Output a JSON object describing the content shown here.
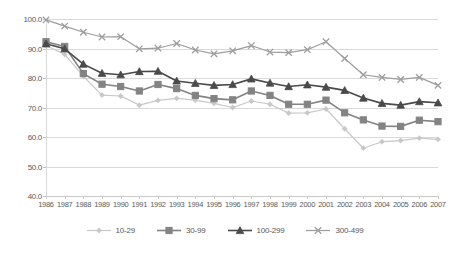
{
  "chart_data": {
    "type": "line",
    "title": "",
    "xlabel": "",
    "ylabel": "",
    "grid": true,
    "legend_position": "bottom",
    "ylim": [
      40.0,
      100.0
    ],
    "yticks": [
      "100.0",
      "90.0",
      "80.0",
      "70.0",
      "60.0",
      "50.0",
      "40.0"
    ],
    "ytick_values": [
      100.0,
      90.0,
      80.0,
      70.0,
      60.0,
      50.0,
      40.0
    ],
    "categories": [
      "1986",
      "1987",
      "1988",
      "1989",
      "1990",
      "1991",
      "1992",
      "1993",
      "1994",
      "1995",
      "1996",
      "1997",
      "1998",
      "1999",
      "2000",
      "2001",
      "2002",
      "2003",
      "2004",
      "2005",
      "2006",
      "2007"
    ],
    "series": [
      {
        "name": "10-29",
        "marker": "diamond",
        "color": "#c8c8c8",
        "values": [
          91.0,
          88.0,
          80.6,
          74.2,
          73.9,
          70.8,
          72.4,
          73.1,
          72.5,
          71.4,
          70.0,
          72.2,
          71.1,
          68.1,
          68.2,
          69.5,
          62.8,
          56.2,
          58.4,
          58.8,
          59.6,
          59.2
        ]
      },
      {
        "name": "30-99",
        "marker": "square",
        "color": "#838383",
        "values": [
          92.3,
          90.7,
          81.5,
          77.9,
          77.1,
          75.6,
          77.8,
          76.4,
          74.1,
          73.0,
          72.6,
          75.6,
          74.1,
          71.1,
          71.1,
          72.5,
          68.2,
          65.8,
          63.7,
          63.6,
          65.7,
          65.2
        ]
      },
      {
        "name": "100-299",
        "marker": "triangle",
        "color": "#4a4a4a",
        "values": [
          91.6,
          89.9,
          84.7,
          81.6,
          81.1,
          82.2,
          82.3,
          79.0,
          78.2,
          77.5,
          77.8,
          79.7,
          78.3,
          77.1,
          77.7,
          76.9,
          75.8,
          73.2,
          71.4,
          70.8,
          72.0,
          71.6
        ]
      },
      {
        "name": "300-499",
        "marker": "cross",
        "color": "#9d9d9d",
        "values": [
          99.7,
          97.6,
          95.5,
          93.9,
          94.0,
          89.9,
          90.1,
          91.7,
          89.5,
          88.2,
          89.2,
          91.0,
          88.8,
          88.6,
          89.6,
          92.3,
          86.6,
          81.1,
          80.2,
          79.5,
          80.2,
          77.5
        ]
      }
    ]
  }
}
